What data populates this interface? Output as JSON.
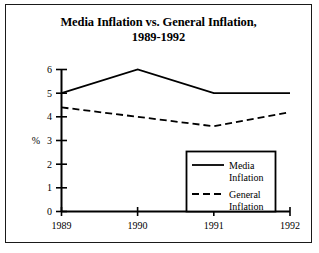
{
  "chart_data": {
    "type": "line",
    "title": "Media Inflation vs. General Inflation, 1989-1992",
    "title_line1": "Media Inflation vs. General Inflation,",
    "title_line2": "1989-1992",
    "xlabel": "",
    "ylabel": "%",
    "categories": [
      "1989",
      "1990",
      "1991",
      "1992"
    ],
    "x": [
      1989,
      1990,
      1991,
      1992
    ],
    "xlim": [
      1989,
      1992
    ],
    "ylim": [
      0,
      6
    ],
    "yticks": [
      "0",
      "1",
      "2",
      "3",
      "4",
      "5",
      "6"
    ],
    "ytick_values": [
      0,
      1,
      2,
      3,
      4,
      5,
      6
    ],
    "grid": false,
    "legend_position": "inside-bottom-right",
    "series": [
      {
        "name": "Media Inflation",
        "name_line1": "Media",
        "name_line2": "Inflation",
        "style": "solid",
        "color": "#000000",
        "values": [
          5.0,
          6.0,
          5.0,
          5.0
        ]
      },
      {
        "name": "General Inflation",
        "name_line1": "General",
        "name_line2": "Inflation",
        "style": "dashed",
        "color": "#000000",
        "values": [
          4.4,
          4.0,
          3.6,
          4.2
        ]
      }
    ]
  },
  "legend": {
    "items": [
      {
        "label_line1": "Media",
        "label_line2": "Inflation",
        "style": "solid"
      },
      {
        "label_line1": "General",
        "label_line2": "Inflation",
        "style": "dashed"
      }
    ]
  },
  "colors": {
    "frame": "#1a1a1a",
    "axis": "#000000",
    "background": "#ffffff",
    "line": "#000000"
  }
}
